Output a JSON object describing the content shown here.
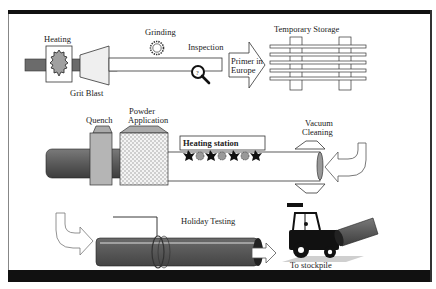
{
  "diagram": {
    "type": "process-flow",
    "colors": {
      "frame": "#111111",
      "pipe_dark": "#555555",
      "pipe_mid": "#777777",
      "quench": "#b5b5b5",
      "grit_blast": "#efefef",
      "heating_core": "#a0a0a0",
      "shadow": "#cfcfcf"
    },
    "stages": {
      "heating": "Heating",
      "grit_blast": "Grit Blast",
      "grinding": "Grinding",
      "inspection": "Inspection",
      "inspection_mark": "?",
      "primer_line1": "Primer in",
      "primer_line2": "Europe",
      "temporary_storage": "Temporary Storage",
      "quench": "Quench",
      "powder_line1": "Powder",
      "powder_line2": "Application",
      "heating_station": "Heating station",
      "vacuum_line1": "Vacuum",
      "vacuum_line2": "Cleaning",
      "holiday_testing": "Holiday Testing",
      "to_stockpile": "To stockpile"
    }
  }
}
